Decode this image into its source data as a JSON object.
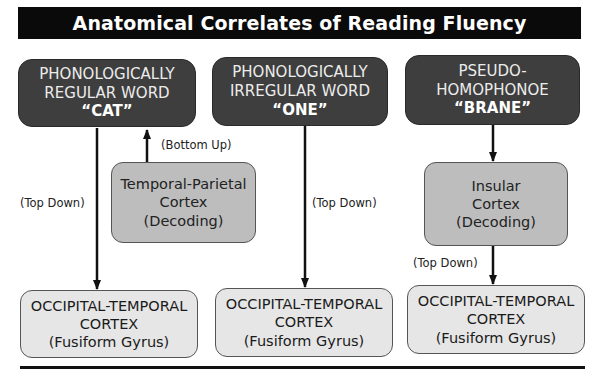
{
  "title": "Anatomical Correlates of Reading Fluency",
  "columns": [
    {
      "word_type_lines": [
        "PHONOLOGICALLY",
        "REGULAR WORD"
      ],
      "example": "“CAT”",
      "decoding_box": {
        "lines": [
          "Temporal-Parietal",
          "Cortex",
          "(Decoding)"
        ]
      },
      "path_labels": {
        "top_down": "(Top Down)",
        "bottom_up": "(Bottom Up)"
      },
      "target": {
        "lines": [
          "OCCIPITAL-TEMPORAL",
          "CORTEX",
          "(Fusiform Gyrus)"
        ]
      }
    },
    {
      "word_type_lines": [
        "PHONOLOGICALLY",
        "IRREGULAR WORD"
      ],
      "example": "“ONE”",
      "path_labels": {
        "top_down": "(Top Down)"
      },
      "target": {
        "lines": [
          "OCCIPITAL-TEMPORAL",
          "CORTEX",
          "(Fusiform Gyrus)"
        ]
      }
    },
    {
      "word_type_lines": [
        "PSEUDO-",
        "HOMOPHONOE"
      ],
      "example": "“BRANE”",
      "decoding_box": {
        "lines": [
          "Insular",
          "Cortex",
          "(Decoding)"
        ]
      },
      "path_labels": {
        "top_down": "(Top Down)"
      },
      "target": {
        "lines": [
          "OCCIPITAL-TEMPORAL",
          "CORTEX",
          "(Fusiform Gyrus)"
        ]
      }
    }
  ],
  "colors": {
    "title_bg": "#0a0a0a",
    "word_box_bg": "#3e3e3e",
    "decoding_box_bg": "#bdbdbd",
    "target_box_bg": "#e6e6e6"
  }
}
